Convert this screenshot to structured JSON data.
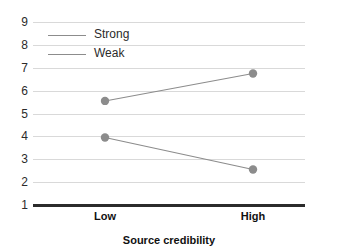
{
  "chart_data": {
    "type": "line",
    "title": "",
    "xlabel": "Source credibility",
    "ylabel": "",
    "categories": [
      "Low",
      "High"
    ],
    "series": [
      {
        "name": "Strong",
        "values": [
          5.55,
          6.75
        ],
        "color": "#8c8c8c",
        "marker": "circle"
      },
      {
        "name": "Weak",
        "values": [
          3.95,
          2.55
        ],
        "color": "#8c8c8c",
        "marker": "circle"
      }
    ],
    "ylim": [
      1,
      9
    ],
    "yticks": [
      1,
      2,
      3,
      4,
      5,
      6,
      7,
      8,
      9
    ],
    "ytick_labels": [
      "1",
      "2",
      "3",
      "4",
      "5",
      "6",
      "7",
      "8",
      "9"
    ],
    "xtick_labels": [
      "Low",
      "High"
    ],
    "grid": true,
    "legend_position": "top-left",
    "legend_entries": [
      "Strong",
      "Weak"
    ],
    "axis_color": "#2b2b2b",
    "grid_color": "#d9d9d9",
    "background": "#ffffff"
  },
  "axis": {
    "y_labels": {
      "t9": "9",
      "t8": "8",
      "t7": "7",
      "t6": "6",
      "t5": "5",
      "t4": "4",
      "t3": "3",
      "t2": "2",
      "t1": "1"
    },
    "x_labels": {
      "low": "Low",
      "high": "High"
    },
    "x_title": "Source credibility"
  },
  "legend": {
    "items": [
      {
        "label": "Strong"
      },
      {
        "label": "Weak"
      }
    ]
  }
}
